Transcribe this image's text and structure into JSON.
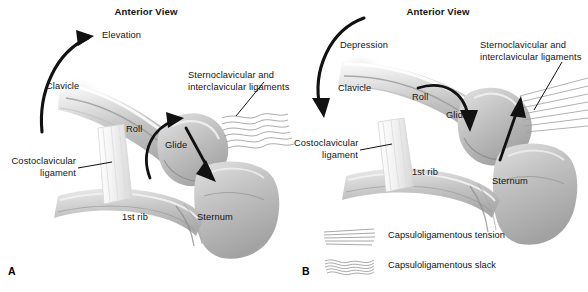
{
  "figure": {
    "width": 588,
    "height": 292,
    "background": "#ffffff",
    "ink": "#141414",
    "bone_fill": "#c9c9c9",
    "bone_light": "#e8e8e8",
    "bone_shadow": "#9a9a9a",
    "arrow_color": "#111111"
  },
  "panels": [
    {
      "id": "A",
      "letter": "A",
      "title": "Anterior View",
      "motion_label": "Elevation",
      "motion_direction": "upward-counterclockwise",
      "labels": {
        "clavicle": "Clavicle",
        "ligaments": "Sternoclavicular and\ninterclavicular ligaments",
        "ligaments_line1": "Sternoclavicular and",
        "ligaments_line2": "interclavicular ligaments",
        "costoclavicular_line1": "Costoclavicular",
        "costoclavicular_line2": "ligament",
        "first_rib": "1st rib",
        "sternum": "Sternum",
        "roll": "Roll",
        "glide": "Glide"
      },
      "arthrokinematics": {
        "roll_direction": "superior",
        "glide_direction": "inferior",
        "capsule_state": "slack"
      }
    },
    {
      "id": "B",
      "letter": "B",
      "title": "Anterior View",
      "motion_label": "Depression",
      "motion_direction": "downward-clockwise",
      "labels": {
        "clavicle": "Clavicle",
        "ligaments": "Sternoclavicular and\ninterclavicular ligaments",
        "ligaments_line1": "Sternoclavicular and",
        "ligaments_line2": "interclavicular ligaments",
        "costoclavicular_line1": "Costoclavicular",
        "costoclavicular_line2": "ligament",
        "first_rib": "1st rib",
        "sternum": "Sternum",
        "roll": "Roll",
        "glide": "Glide"
      },
      "arthrokinematics": {
        "roll_direction": "inferior",
        "glide_direction": "superior",
        "capsule_state": "tension"
      }
    }
  ],
  "legend": {
    "items": [
      {
        "glyph": "straight-fibers-icon",
        "label": "Capsuloligamentous tension"
      },
      {
        "glyph": "wavy-fibers-icon",
        "label": "Capsuloligamentous slack"
      }
    ]
  }
}
